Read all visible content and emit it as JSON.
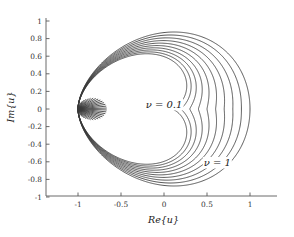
{
  "chart_data": {
    "type": "line",
    "title": "",
    "xlabel": "Re{u}",
    "ylabel": "Im{u}",
    "xlim": [
      -1.35,
      1.35
    ],
    "ylim": [
      -1.12,
      1.12
    ],
    "xticks": [
      -1,
      -0.5,
      0,
      0.5,
      1
    ],
    "xticklabels": [
      "-1",
      "-0.5",
      "0",
      "0.5",
      "1"
    ],
    "yticks": [
      -1,
      -0.8,
      -0.6,
      -0.4,
      -0.2,
      0,
      0.2,
      0.4,
      0.6,
      0.8,
      1
    ],
    "yticklabels": [
      "-1",
      "-0.8",
      "-0.6",
      "-0.4",
      "-0.2",
      "0",
      "0.2",
      "0.4",
      "0.6",
      "0.8",
      "1"
    ],
    "grid": false,
    "legend": null,
    "line_color": "#3a3a3a",
    "axis_color": "#5a5a5a",
    "background": "#ffffff",
    "common_point": [
      -1,
      0
    ],
    "parameter_symbol": "ν",
    "parameter_values": [
      0.1,
      0.2,
      0.3,
      0.4,
      0.5,
      0.6,
      0.7,
      0.8,
      0.9,
      1.0
    ],
    "series": [
      {
        "name": "ν = 0.1",
        "nu": 0.1,
        "right_intercept": 0.1,
        "max_imag": 0.1
      },
      {
        "name": "ν = 0.2",
        "nu": 0.2,
        "right_intercept": 0.2,
        "max_imag": 0.2
      },
      {
        "name": "ν = 0.3",
        "nu": 0.3,
        "right_intercept": 0.3,
        "max_imag": 0.3
      },
      {
        "name": "ν = 0.4",
        "nu": 0.4,
        "right_intercept": 0.4,
        "max_imag": 0.4
      },
      {
        "name": "ν = 0.5",
        "nu": 0.5,
        "right_intercept": 0.5,
        "max_imag": 0.5
      },
      {
        "name": "ν = 0.6",
        "nu": 0.6,
        "right_intercept": 0.6,
        "max_imag": 0.6
      },
      {
        "name": "ν = 0.7",
        "nu": 0.7,
        "right_intercept": 0.7,
        "max_imag": 0.7
      },
      {
        "name": "ν = 0.8",
        "nu": 0.8,
        "right_intercept": 0.8,
        "max_imag": 0.8
      },
      {
        "name": "ν = 0.9",
        "nu": 0.9,
        "right_intercept": 0.9,
        "max_imag": 0.9
      },
      {
        "name": "ν = 1",
        "nu": 1.0,
        "right_intercept": 1.0,
        "max_imag": 1.0
      }
    ],
    "annotations": [
      {
        "text": "ν = 0.1",
        "x": 0.0,
        "y": 0.03,
        "name": "annotation-nu-0.1"
      },
      {
        "text": "ν = 1",
        "x": 0.62,
        "y": -0.63,
        "name": "annotation-nu-1"
      }
    ]
  }
}
